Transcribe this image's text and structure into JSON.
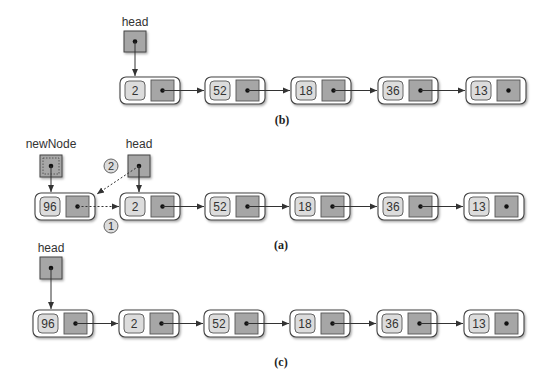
{
  "colors": {
    "node_outer_fill": "#ffffff",
    "node_outer_stroke": "#444444",
    "data_cell_fill": "#dcdcdc",
    "pointer_cell_fill": "#a6a6a6",
    "line": "#333333"
  },
  "diagrams": [
    {
      "id": "b",
      "caption": "(b)",
      "pointers": [
        {
          "label": "head",
          "target": 0,
          "style": "solid"
        }
      ],
      "nodes": [
        "2",
        "52",
        "18",
        "36",
        "13"
      ]
    },
    {
      "id": "a",
      "caption": "(a)",
      "pointers": [
        {
          "label": "newNode",
          "target": 0,
          "style": "dashed-box"
        },
        {
          "label": "head",
          "target": 1,
          "style": "solid"
        }
      ],
      "nodes": [
        "96",
        "2",
        "52",
        "18",
        "36",
        "13"
      ],
      "steps": [
        {
          "number": "1",
          "description": "newNode.next = head (dotted link from 96 to 2)"
        },
        {
          "number": "2",
          "description": "head = newNode (dotted link from head to 96)"
        }
      ]
    },
    {
      "id": "c",
      "caption": "(c)",
      "pointers": [
        {
          "label": "head",
          "target": 0,
          "style": "solid"
        }
      ],
      "nodes": [
        "96",
        "2",
        "52",
        "18",
        "36",
        "13"
      ]
    }
  ]
}
